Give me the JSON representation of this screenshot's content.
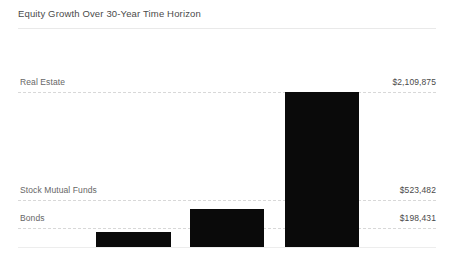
{
  "chart_data": {
    "type": "bar",
    "title": "Equity Growth Over 30-Year Time Horizon",
    "xlabel": "",
    "ylabel": "",
    "grid": true,
    "grid_style": "dashed-horizontal",
    "legend": "none",
    "orientation": "vertical",
    "bar_color": "#0a0a0a",
    "baseline_value": 0,
    "ylim": [
      0,
      2109875
    ],
    "categories": [
      "Bonds",
      "Stock Mutual Funds",
      "Real Estate"
    ],
    "values": [
      198431,
      523482,
      2109875
    ],
    "value_labels": [
      "$198,431",
      "$523,482",
      "$2,109,875"
    ],
    "series": [
      {
        "name": "Equity Growth",
        "values": [
          198431,
          523482,
          2109875
        ]
      }
    ],
    "points": [
      {
        "category": "Bonds",
        "value": 198431,
        "value_label": "$198,431"
      },
      {
        "category": "Stock Mutual Funds",
        "value": 523482,
        "value_label": "$523,482"
      },
      {
        "category": "Real Estate",
        "value": 2109875,
        "value_label": "$2,109,875"
      }
    ],
    "annotations": [
      {
        "label": "Real Estate",
        "value_label": "$2,109,875"
      },
      {
        "label": "Stock Mutual Funds",
        "value_label": "$523,482"
      },
      {
        "label": "Bonds",
        "value_label": "$198,431"
      }
    ]
  },
  "colors": {
    "bar": "#0a0a0a",
    "gridline": "#d8d8d8",
    "baseline": "#ededed",
    "title_rule": "#e9e9e9",
    "title_text": "#4a4a4a",
    "category_text": "#666666",
    "value_text": "#4a4a4a",
    "background": "#ffffff"
  }
}
